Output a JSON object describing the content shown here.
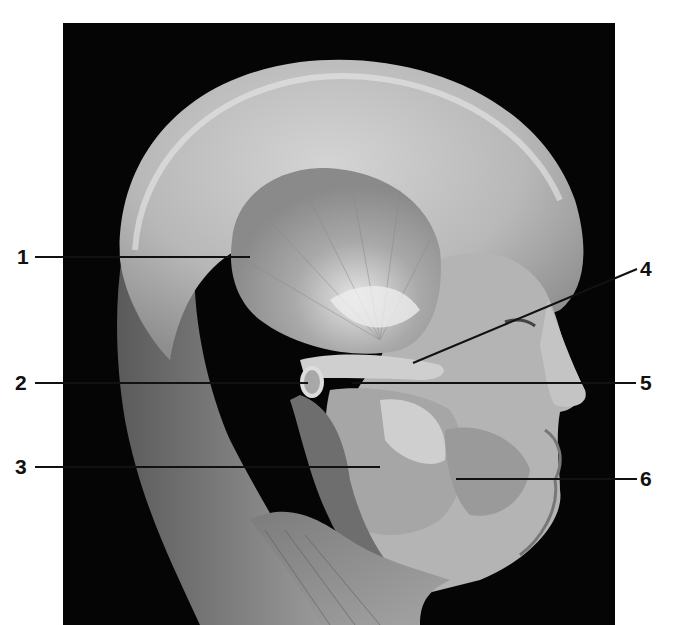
{
  "figure": {
    "background_color": "#ffffff",
    "photo_background": "#050505",
    "labels": [
      {
        "number": "1",
        "side": "left",
        "x": 17,
        "y": 246,
        "line": [
          35,
          257,
          250,
          257
        ]
      },
      {
        "number": "2",
        "side": "left",
        "x": 15,
        "y": 372,
        "line": [
          35,
          383,
          308,
          383
        ]
      },
      {
        "number": "3",
        "side": "left",
        "x": 15,
        "y": 456,
        "line": [
          35,
          467,
          380,
          467
        ]
      },
      {
        "number": "4",
        "side": "right",
        "x": 640,
        "y": 258,
        "line": [
          637,
          269,
          413,
          363
        ]
      },
      {
        "number": "5",
        "side": "right",
        "x": 640,
        "y": 372,
        "line": [
          352,
          383,
          636,
          383
        ]
      },
      {
        "number": "6",
        "side": "right",
        "x": 640,
        "y": 468,
        "line": [
          456,
          479,
          637,
          479
        ]
      }
    ]
  }
}
